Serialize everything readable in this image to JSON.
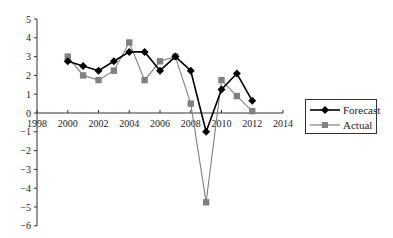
{
  "chart_data": {
    "type": "line",
    "title": "",
    "xlabel": "",
    "ylabel": "",
    "x": [
      2000,
      2001,
      2002,
      2003,
      2004,
      2005,
      2006,
      2007,
      2008,
      2009,
      2010,
      2011,
      2012
    ],
    "series": [
      {
        "name": "Forecast",
        "color": "#000000",
        "marker": "diamond",
        "values": [
          2.75,
          2.5,
          2.25,
          2.75,
          3.25,
          3.25,
          2.25,
          3.0,
          2.25,
          -1.0,
          1.25,
          2.1,
          0.65
        ]
      },
      {
        "name": "Actual",
        "color": "#808080",
        "marker": "square",
        "values": [
          3.0,
          2.0,
          1.75,
          2.25,
          3.75,
          1.75,
          2.75,
          3.0,
          0.5,
          -4.75,
          1.75,
          0.9,
          0.1
        ]
      }
    ],
    "xlim": [
      1998,
      2014
    ],
    "ylim": [
      -6,
      5
    ],
    "xticks": [
      "1998",
      "2000",
      "2002",
      "2004",
      "2006",
      "2008",
      "2010",
      "2012",
      "2014"
    ],
    "yticks": [
      "5",
      "4",
      "3",
      "2",
      "1",
      "0",
      "−1",
      "−2",
      "−3",
      "−4",
      "−5",
      "−6"
    ],
    "grid": false,
    "legend_position": "right"
  },
  "legend": {
    "forecast_label": "Forecast",
    "actual_label": "Actual"
  }
}
